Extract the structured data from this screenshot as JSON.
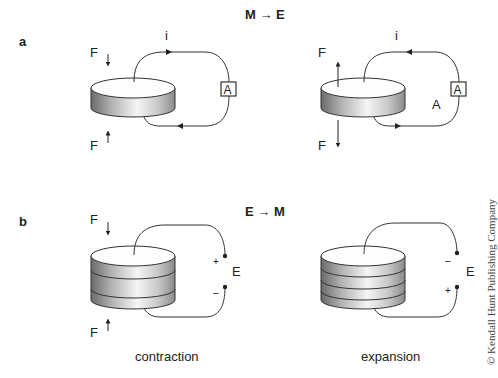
{
  "title": {
    "top": "M → E",
    "middle": "E → M"
  },
  "panels": {
    "a": {
      "label": "a",
      "left": {
        "force_top": "F",
        "force_bottom": "F",
        "current": "i",
        "meter": "A",
        "force_direction": "inward",
        "current_direction": "clockwise"
      },
      "right": {
        "force_top": "F",
        "force_bottom": "F",
        "current": "i",
        "meter": "A",
        "extra_label": "A",
        "force_direction": "outward",
        "current_direction": "counterclockwise"
      }
    },
    "b": {
      "label": "b",
      "left": {
        "force_top": "F",
        "force_bottom": "F",
        "voltage": "E",
        "top_terminal": "+",
        "bottom_terminal": "–",
        "caption": "contraction",
        "layers": 3
      },
      "right": {
        "voltage": "E",
        "top_terminal": "–",
        "bottom_terminal": "+",
        "caption": "expansion",
        "layers": 4
      }
    }
  },
  "copyright": "© Kendall Hunt Publishing Company",
  "colors": {
    "line": "#333333",
    "cyl_dark": "#6e6e6e",
    "cyl_light": "#f4f4f4",
    "text": "#222222"
  }
}
